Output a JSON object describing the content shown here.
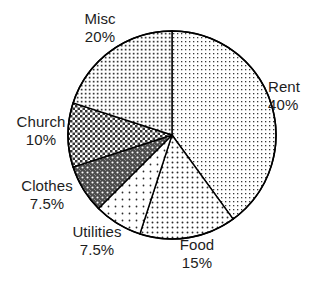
{
  "chart_data": {
    "type": "pie",
    "title": "",
    "subtitle": "",
    "xlabel": "",
    "ylabel": "",
    "legend_position": "none",
    "grid": false,
    "label_format": "name + percent",
    "start_angle_deg": 90,
    "direction": "clockwise",
    "categories": [
      "Rent",
      "Food",
      "Utilities",
      "Clothes",
      "Church",
      "Misc"
    ],
    "values": [
      40,
      15,
      7.5,
      7.5,
      10,
      20
    ],
    "units": "%",
    "slices": [
      {
        "name": "Rent",
        "value": 40,
        "percent_text": "40%",
        "pattern": "fine-dots-light",
        "fill_color": "#ffffff",
        "pattern_color": "#3a3a3a",
        "outline_color": "#000000",
        "start_deg": 0,
        "end_deg": 144
      },
      {
        "name": "Food",
        "value": 15,
        "percent_text": "15%",
        "pattern": "medium-dots",
        "fill_color": "#ffffff",
        "pattern_color": "#2b2b2b",
        "outline_color": "#000000",
        "start_deg": 144,
        "end_deg": 198
      },
      {
        "name": "Utilities",
        "value": 7.5,
        "percent_text": "7.5%",
        "pattern": "sparse-dots",
        "fill_color": "#ffffff",
        "pattern_color": "#2b2b2b",
        "outline_color": "#000000",
        "start_deg": 198,
        "end_deg": 225
      },
      {
        "name": "Clothes",
        "value": 7.5,
        "percent_text": "7.5%",
        "pattern": "dark-dots-on-gray",
        "fill_color": "#4c4c4c",
        "pattern_color": "#ffffff",
        "outline_color": "#000000",
        "start_deg": 225,
        "end_deg": 252
      },
      {
        "name": "Church",
        "value": 10,
        "percent_text": "10%",
        "pattern": "checkerboard-crosshatch",
        "fill_color": "#ffffff",
        "pattern_color": "#333333",
        "outline_color": "#000000",
        "start_deg": 252,
        "end_deg": 288
      },
      {
        "name": "Misc",
        "value": 20,
        "percent_text": "20%",
        "pattern": "dense-dot-grid",
        "fill_color": "#ffffff",
        "pattern_color": "#3a3a3a",
        "outline_color": "#000000",
        "start_deg": 288,
        "end_deg": 360
      }
    ]
  },
  "labels": {
    "misc": {
      "name": "Misc",
      "value": "20%"
    },
    "rent": {
      "name": "Rent",
      "value": "40%"
    },
    "church": {
      "name": "Church",
      "value": "10%"
    },
    "clothes": {
      "name": "Clothes",
      "value": "7.5%"
    },
    "utilities": {
      "name": "Utilities",
      "value": "7.5%"
    },
    "food": {
      "name": "Food",
      "value": "15%"
    }
  },
  "geometry": {
    "center_x": 172,
    "center_y": 135,
    "radius": 104
  },
  "colors": {
    "background": "#ffffff",
    "outline": "#000000",
    "text": "#1d1d1d"
  }
}
